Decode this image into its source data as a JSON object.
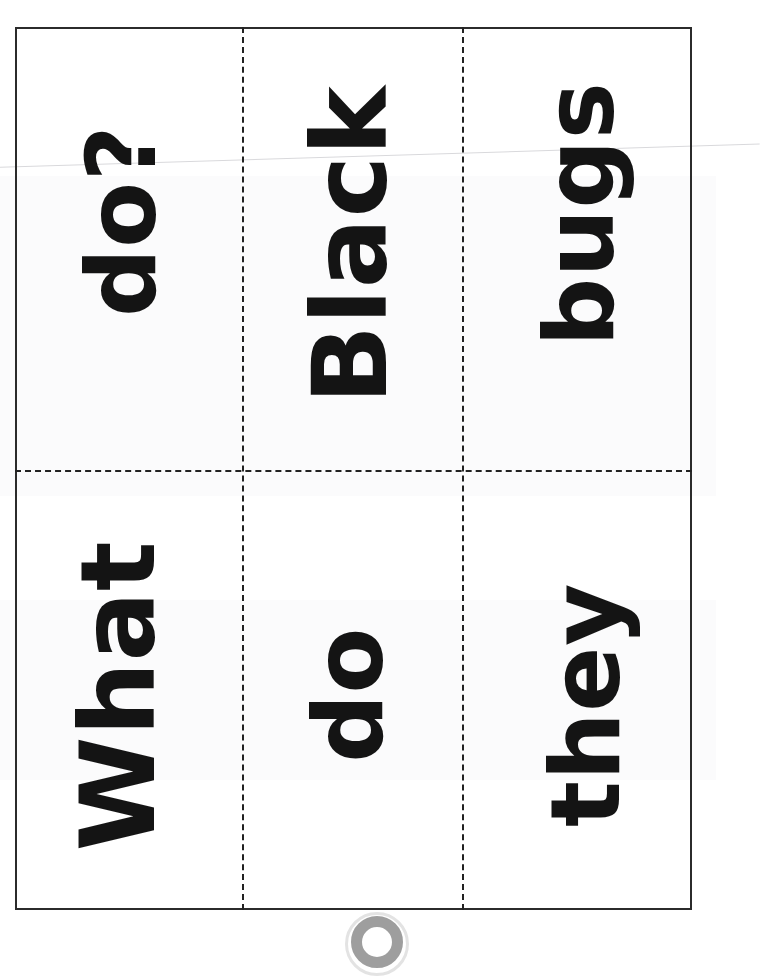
{
  "page": {
    "kind": "scanned-worksheet",
    "background_color": "#ffffff",
    "ink_color": "#141414",
    "border_color": "#2b2b2b",
    "cut_line_color": "#222222",
    "crease_color": "#d9d9dc",
    "artifact_color": "#8d8d8d",
    "width_px": 716,
    "height_px": 932
  },
  "grid": {
    "columns": 3,
    "rows": 2,
    "border_left_px": 15,
    "border_top_px": 27,
    "border_right_px": 692,
    "border_bottom_px": 910,
    "vertical_cut_x_px": [
      242,
      462
    ],
    "horizontal_cut_y_px": [
      470
    ]
  },
  "cards": [
    {
      "id": "card-r1c1",
      "row": 1,
      "column": 1,
      "word": "do?",
      "rotation_deg": -90,
      "font_size_px": 96
    },
    {
      "id": "card-r1c2",
      "row": 1,
      "column": 2,
      "word": "Black",
      "rotation_deg": -90,
      "font_size_px": 104
    },
    {
      "id": "card-r1c3",
      "row": 1,
      "column": 3,
      "word": "bugs",
      "rotation_deg": -90,
      "font_size_px": 96
    },
    {
      "id": "card-r2c1",
      "row": 2,
      "column": 1,
      "word": "What",
      "rotation_deg": -90,
      "font_size_px": 104
    },
    {
      "id": "card-r2c2",
      "row": 2,
      "column": 2,
      "word": "do",
      "rotation_deg": -90,
      "font_size_px": 96
    },
    {
      "id": "card-r2c3",
      "row": 2,
      "column": 3,
      "word": "they",
      "rotation_deg": -90,
      "font_size_px": 96
    }
  ],
  "sentence_reading_order": [
    "What",
    "do",
    "they",
    "do?",
    "Black",
    "bugs"
  ],
  "artifacts": {
    "crease_label": "diagonal-scan-crease",
    "ring_label": "binder-ring-shadow"
  }
}
